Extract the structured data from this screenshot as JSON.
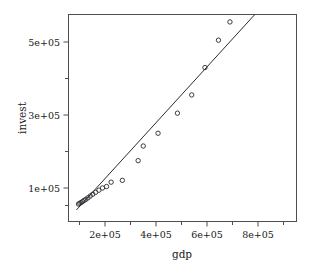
{
  "chart_data": {
    "type": "scatter",
    "title": "",
    "xlabel": "gdp",
    "ylabel": "invest",
    "xlim": [
      80000,
      930000
    ],
    "ylim": [
      48000,
      640000
    ],
    "grid": false,
    "legend": null,
    "x_ticks": [
      200000,
      400000,
      600000,
      800000
    ],
    "x_tick_labels": [
      "2e+05",
      "4e+05",
      "6e+05",
      "8e+05"
    ],
    "x_minor_ticks": [
      100000,
      300000,
      500000,
      700000,
      900000
    ],
    "y_ticks": [
      100000,
      300000,
      500000
    ],
    "y_tick_labels": [
      "1e+05",
      "3e+05",
      "5e+05"
    ],
    "y_minor_ticks": [
      200000,
      400000,
      600000
    ],
    "marker": "open-circle",
    "x": [
      96000,
      101000,
      106000,
      112000,
      118000,
      125000,
      133000,
      142000,
      152000,
      163000,
      176000,
      190000,
      206000,
      224000,
      268000,
      330000,
      350000,
      408000,
      484000,
      540000,
      592000,
      645000,
      690000,
      740000,
      820000,
      905000
    ],
    "y": [
      56000,
      58000,
      60000,
      63000,
      66000,
      69000,
      73000,
      78000,
      83000,
      88000,
      94000,
      100000,
      104000,
      116000,
      121000,
      175000,
      215000,
      250000,
      305000,
      355000,
      430000,
      505000,
      555000,
      590000,
      620000,
      620000
    ],
    "series": [
      {
        "name": "observations",
        "marker": "open-circle",
        "points": [
          [
            96000,
            56000
          ],
          [
            101000,
            58000
          ],
          [
            106000,
            60000
          ],
          [
            112000,
            63000
          ],
          [
            118000,
            66000
          ],
          [
            125000,
            69000
          ],
          [
            133000,
            73000
          ],
          [
            142000,
            78000
          ],
          [
            152000,
            83000
          ],
          [
            163000,
            88000
          ],
          [
            176000,
            94000
          ],
          [
            190000,
            100000
          ],
          [
            206000,
            104000
          ],
          [
            224000,
            116000
          ],
          [
            268000,
            121000
          ],
          [
            330000,
            175000
          ],
          [
            350000,
            215000
          ],
          [
            408000,
            250000
          ],
          [
            484000,
            305000
          ],
          [
            540000,
            355000
          ],
          [
            592000,
            430000
          ],
          [
            645000,
            505000
          ],
          [
            690000,
            555000
          ],
          [
            740000,
            590000
          ],
          [
            820000,
            620000
          ],
          [
            905000,
            620000
          ]
        ]
      }
    ],
    "fit_line": {
      "name": "regression-line",
      "type": "linear",
      "start": [
        88000,
        40000
      ],
      "end": [
        885000,
        650000
      ]
    }
  },
  "axes": {
    "x_axis_title": "gdp",
    "y_axis_title": "invest",
    "x_tick_labels": [
      "2e+05",
      "4e+05",
      "6e+05",
      "8e+05"
    ],
    "y_tick_labels": [
      "1e+05",
      "3e+05",
      "5e+05"
    ]
  },
  "colors": {
    "background": "#ffffff",
    "frame": "#4d4d55",
    "point_stroke": "#2a2a30",
    "line": "#2a2a30",
    "text": "#1a1a1a"
  }
}
